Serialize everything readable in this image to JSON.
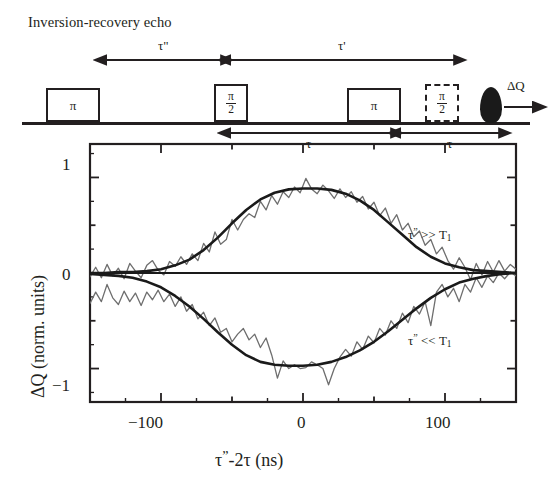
{
  "figure": {
    "title": "Inversion-recovery echo"
  },
  "pulse_sequence": {
    "boxes": [
      {
        "name": "pulse-pi-1",
        "label": "π",
        "style": "solid",
        "type": "simple"
      },
      {
        "name": "pulse-pi-over-2-1",
        "numerator": "π",
        "denominator": "2",
        "style": "solid",
        "type": "fraction"
      },
      {
        "name": "pulse-pi-2",
        "label": "π",
        "style": "solid",
        "type": "simple"
      },
      {
        "name": "pulse-pi-over-2-2",
        "numerator": "π",
        "denominator": "2",
        "style": "dashed",
        "type": "fraction"
      }
    ],
    "interval_labels": {
      "tau_double_prime": "τ\"",
      "tau_prime": "τ'",
      "tau_first": "τ",
      "tau_second": "τ"
    },
    "echo": {
      "name": "echo-signal",
      "readout_label": "ΔQ"
    }
  },
  "chart_data": {
    "type": "line",
    "title": "",
    "xlabel": "τ\"-2τ (ns)",
    "ylabel": "ΔQ (norm. units)",
    "xlim": [
      -150,
      150
    ],
    "ylim": [
      -1.35,
      1.35
    ],
    "xticks": [
      -150,
      -100,
      -50,
      0,
      50,
      100,
      150
    ],
    "xtick_labels": [
      "",
      "−100",
      "",
      "0",
      "",
      "100",
      ""
    ],
    "yticks": [
      -1,
      -0.5,
      0,
      0.5,
      1
    ],
    "ytick_labels": [
      "−1",
      "",
      "0",
      "",
      "1"
    ],
    "grid": false,
    "legend": "inline-annotations",
    "annotations": [
      {
        "name": "annot-slow-recovery",
        "text": "τ\" >> T₁",
        "x": 95,
        "y": 0.62
      },
      {
        "name": "annot-fast-recovery",
        "text": "τ\" << T₁",
        "x": 95,
        "y": -0.55
      }
    ],
    "series": [
      {
        "name": "fit-positive",
        "role": "fit",
        "color": "#1a1a1a",
        "x": [
          -150,
          -140,
          -130,
          -120,
          -110,
          -100,
          -90,
          -80,
          -70,
          -60,
          -50,
          -40,
          -30,
          -20,
          -10,
          0,
          10,
          20,
          30,
          40,
          50,
          60,
          70,
          80,
          90,
          100,
          110,
          120,
          130,
          140,
          150
        ],
        "y": [
          0.0,
          0.0,
          0.01,
          0.01,
          0.02,
          0.04,
          0.08,
          0.14,
          0.24,
          0.37,
          0.52,
          0.66,
          0.77,
          0.84,
          0.875,
          0.885,
          0.885,
          0.87,
          0.83,
          0.76,
          0.66,
          0.53,
          0.4,
          0.27,
          0.17,
          0.1,
          0.06,
          0.03,
          0.02,
          0.01,
          0.0
        ]
      },
      {
        "name": "fit-negative",
        "role": "fit",
        "color": "#1a1a1a",
        "x": [
          -150,
          -140,
          -130,
          -120,
          -110,
          -100,
          -90,
          -80,
          -70,
          -60,
          -50,
          -40,
          -30,
          -20,
          -10,
          0,
          10,
          20,
          30,
          40,
          50,
          60,
          70,
          80,
          90,
          100,
          110,
          120,
          130,
          140,
          150
        ],
        "y": [
          -0.01,
          -0.02,
          -0.03,
          -0.05,
          -0.09,
          -0.15,
          -0.24,
          -0.35,
          -0.48,
          -0.62,
          -0.75,
          -0.86,
          -0.93,
          -0.96,
          -0.97,
          -0.97,
          -0.96,
          -0.93,
          -0.88,
          -0.81,
          -0.72,
          -0.61,
          -0.49,
          -0.37,
          -0.26,
          -0.17,
          -0.1,
          -0.06,
          -0.03,
          -0.01,
          0.0
        ]
      },
      {
        "name": "data-positive",
        "role": "data",
        "color": "#6e6e6e",
        "x": [
          -150,
          -146,
          -142,
          -138,
          -134,
          -130,
          -126,
          -122,
          -118,
          -114,
          -110,
          -106,
          -102,
          -98,
          -94,
          -90,
          -86,
          -82,
          -78,
          -74,
          -70,
          -66,
          -62,
          -58,
          -54,
          -50,
          -46,
          -42,
          -38,
          -34,
          -30,
          -26,
          -22,
          -18,
          -14,
          -10,
          -6,
          -2,
          2,
          6,
          10,
          14,
          18,
          22,
          26,
          30,
          34,
          38,
          42,
          46,
          50,
          54,
          58,
          62,
          66,
          70,
          74,
          78,
          82,
          86,
          90,
          94,
          98,
          102,
          106,
          110,
          114,
          118,
          122,
          126,
          130,
          134,
          138,
          142,
          146,
          150
        ],
        "y": [
          -0.04,
          0.06,
          -0.05,
          0.09,
          -0.03,
          0.05,
          -0.06,
          0.1,
          0.02,
          -0.05,
          0.08,
          0.13,
          0.03,
          -0.02,
          0.12,
          0.07,
          0.17,
          0.09,
          0.2,
          0.13,
          0.31,
          0.22,
          0.43,
          0.3,
          0.35,
          0.56,
          0.45,
          0.56,
          0.62,
          0.58,
          0.75,
          0.66,
          0.81,
          0.72,
          0.85,
          0.79,
          0.9,
          0.84,
          0.99,
          0.88,
          0.83,
          0.92,
          0.86,
          0.78,
          0.88,
          0.79,
          0.85,
          0.74,
          0.8,
          0.67,
          0.74,
          0.6,
          0.68,
          0.52,
          0.61,
          0.45,
          0.52,
          0.38,
          0.44,
          0.29,
          0.35,
          0.2,
          0.27,
          0.13,
          0.04,
          0.16,
          0.06,
          -0.07,
          0.1,
          -0.02,
          0.12,
          0.01,
          0.13,
          0.02,
          0.09,
          0.04
        ]
      },
      {
        "name": "data-negative",
        "role": "data",
        "color": "#6e6e6e",
        "x": [
          -150,
          -146,
          -142,
          -138,
          -134,
          -130,
          -126,
          -122,
          -118,
          -114,
          -110,
          -106,
          -102,
          -98,
          -94,
          -90,
          -86,
          -82,
          -78,
          -74,
          -70,
          -66,
          -62,
          -58,
          -54,
          -50,
          -46,
          -42,
          -38,
          -34,
          -30,
          -26,
          -22,
          -18,
          -14,
          -10,
          -6,
          -2,
          2,
          6,
          10,
          14,
          18,
          22,
          26,
          30,
          34,
          38,
          42,
          46,
          50,
          54,
          58,
          62,
          66,
          70,
          74,
          78,
          82,
          86,
          90,
          94,
          98,
          102,
          106,
          110,
          114,
          118,
          122,
          126,
          130,
          134,
          138,
          142,
          146,
          150
        ],
        "y": [
          -0.32,
          -0.2,
          -0.3,
          -0.12,
          -0.26,
          -0.33,
          -0.19,
          -0.3,
          -0.21,
          -0.34,
          -0.2,
          -0.28,
          -0.18,
          -0.3,
          -0.22,
          -0.35,
          -0.25,
          -0.4,
          -0.33,
          -0.48,
          -0.41,
          -0.55,
          -0.47,
          -0.62,
          -0.58,
          -0.72,
          -0.64,
          -0.58,
          -0.7,
          -0.64,
          -0.78,
          -0.68,
          -0.86,
          -1.1,
          -0.92,
          -1.0,
          -0.96,
          -1.0,
          -0.99,
          -0.93,
          -0.96,
          -1.0,
          -1.17,
          -1.0,
          -0.88,
          -0.8,
          -0.87,
          -0.72,
          -0.8,
          -0.66,
          -0.73,
          -0.58,
          -0.65,
          -0.5,
          -0.58,
          -0.42,
          -0.52,
          -0.35,
          -0.43,
          -0.3,
          -0.55,
          -0.2,
          -0.12,
          -0.25,
          -0.16,
          -0.3,
          -0.12,
          -0.2,
          -0.05,
          -0.15,
          -0.03,
          -0.1,
          0.0,
          -0.06,
          0.01,
          -0.03
        ]
      },
      {
        "name": "zero-line",
        "role": "reference",
        "color": "#1a1a1a",
        "x": [
          -150,
          150
        ],
        "y": [
          0,
          0
        ]
      }
    ]
  }
}
